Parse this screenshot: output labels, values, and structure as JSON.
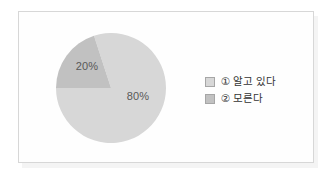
{
  "chart_data": {
    "type": "pie",
    "categories": [
      "① 알고 있다",
      "② 모른다"
    ],
    "values": [
      80,
      20
    ],
    "slice_labels": [
      "80%",
      "20%"
    ],
    "colors": [
      "#d7d7d7",
      "#c1c1c1"
    ],
    "label_color": "#585858",
    "legend_text_color": "#333333",
    "legend_position": "right",
    "start_angle_deg": -18,
    "direction": "clockwise",
    "frame_border_color": "#d7d7d7"
  }
}
